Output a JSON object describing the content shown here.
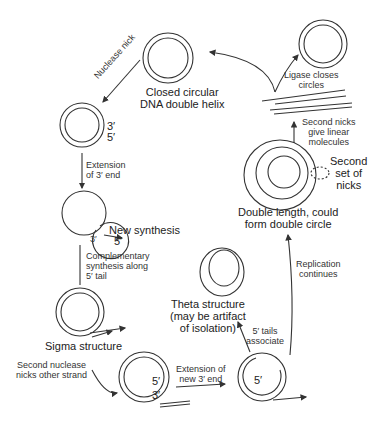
{
  "diagram": {
    "topic": "Rolling-circle / sigma DNA replication",
    "stages": {
      "closed_circle": "Closed circular\nDNA double helix",
      "nuclease_nick": "Nuclease nick",
      "end_labels_1": {
        "three": "3′",
        "five": "5′"
      },
      "extension_3": "Extension\nof 3′ end",
      "new_synthesis": "New synthesis",
      "new_synthesis_3": "3′",
      "new_synthesis_5": "5′",
      "complementary": "Complementary\nsynthesis along\n5′ tail",
      "sigma": "Sigma structure",
      "second_nuclease": "Second nuclease\nnicks other strand",
      "end_labels_2": {
        "five": "5′",
        "three": "3′"
      },
      "extension_new_3": "Extension of\nnew 3′ end",
      "tails_associate": "5′ tails\nassociate",
      "five_prime_center": "5′",
      "theta": "Theta structure\n(may be artifact\nof isolation)",
      "replication_continues": "Replication\ncontinues",
      "double_length": "Double length, could\nform double circle",
      "second_set_nicks": "Second\nset of\nnicks",
      "second_nicks_linear": "Second nicks\ngive linear\nmolecules",
      "ligase": "Ligase closes\ncircles"
    }
  }
}
